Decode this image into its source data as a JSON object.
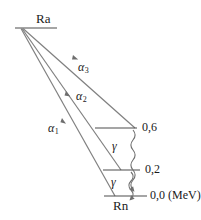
{
  "diagram": {
    "type": "nuclear-decay-scheme",
    "title": "",
    "colors": {
      "line": "#808080",
      "level": "#4d4d4d",
      "text": "#1a1a1a",
      "background": "#ffffff"
    },
    "parent": {
      "symbol": "Ra",
      "level_energy": "",
      "x": 36,
      "y": 18
    },
    "daughter": {
      "symbol": "Rn",
      "x": 120,
      "y": 205
    },
    "levels": [
      {
        "name": "excited-level-0-6",
        "energy_label": "0,6",
        "unit": "",
        "y": 128,
        "x_start": 95,
        "x_end": 137,
        "label_x": 142,
        "label_y": 122
      },
      {
        "name": "excited-level-0-2",
        "energy_label": "0,2",
        "unit": "",
        "y": 170,
        "x_start": 103,
        "x_end": 140,
        "label_x": 145,
        "label_y": 164
      },
      {
        "name": "ground-level-0-0",
        "energy_label": "0,0",
        "unit": "(MeV)",
        "y": 196,
        "x_start": 104,
        "x_end": 147,
        "label_x": 150,
        "label_y": 190
      }
    ],
    "alpha_transitions": [
      {
        "name": "alpha-3",
        "label": "α",
        "subscript": "3",
        "label_x": 78,
        "label_y": 67,
        "x1": 23,
        "y1": 28,
        "x2": 135,
        "y2": 128
      },
      {
        "name": "alpha-2",
        "label": "α",
        "subscript": "2",
        "label_x": 76,
        "label_y": 94,
        "x1": 22,
        "y1": 28,
        "x2": 121,
        "y2": 170
      },
      {
        "name": "alpha-1",
        "label": "α",
        "subscript": "1",
        "label_x": 48,
        "label_y": 126,
        "x1": 21,
        "y1": 28,
        "x2": 115,
        "y2": 196
      }
    ],
    "gamma_transitions": [
      {
        "name": "gamma-upper",
        "label": "γ",
        "label_x": 112,
        "label_y": 140,
        "x": 133,
        "y1": 130,
        "y2": 169,
        "from": "0,6",
        "to": "0,2"
      },
      {
        "name": "gamma-lower",
        "label": "γ",
        "label_x": 111,
        "label_y": 176,
        "x": 131,
        "y1": 172,
        "y2": 195,
        "from": "0,2",
        "to": "0,0"
      }
    ],
    "parent_line": {
      "x_start": 15,
      "x_end": 57,
      "y": 28
    }
  }
}
